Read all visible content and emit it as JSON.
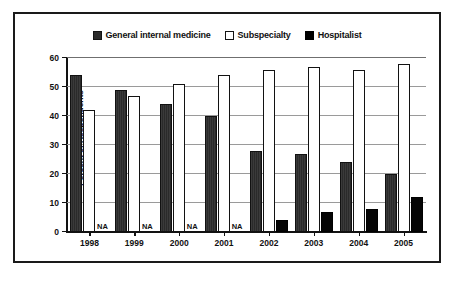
{
  "chart_data": {
    "type": "bar",
    "title": "",
    "xlabel": "",
    "ylabel": "Percent of Respondents",
    "categories": [
      "1998",
      "1999",
      "2000",
      "2001",
      "2002",
      "2003",
      "2004",
      "2005"
    ],
    "ylim": [
      0,
      60
    ],
    "yticks": [
      0,
      10,
      20,
      30,
      40,
      50,
      60
    ],
    "ytick_labels": [
      "0",
      "10",
      "20",
      "30",
      "40",
      "50",
      "60"
    ],
    "grid": true,
    "legend_position": "top-center",
    "na_label": "NA",
    "series": [
      {
        "name": "General internal medicine",
        "swatch": "filled-dark",
        "color": "#333333",
        "values": [
          54,
          49,
          44,
          40,
          28,
          27,
          24,
          20
        ]
      },
      {
        "name": "Subspecialty",
        "swatch": "hollow-white",
        "color": "#ffffff",
        "values": [
          42,
          47,
          51,
          54,
          56,
          57,
          56,
          58
        ]
      },
      {
        "name": "Hospitalist",
        "swatch": "filled-black",
        "color": "#050505",
        "values": [
          null,
          null,
          null,
          null,
          4,
          7,
          8,
          12
        ]
      }
    ]
  }
}
